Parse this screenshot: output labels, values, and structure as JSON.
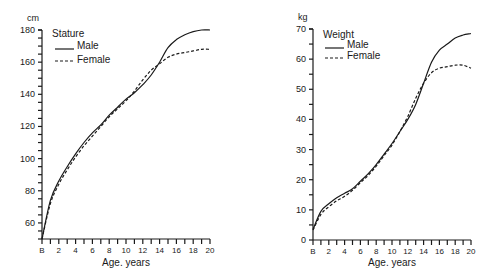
{
  "chart_data": [
    {
      "type": "line",
      "title": "Stature",
      "xlabel": "Age. years",
      "ylabel": "cm",
      "x_tick_labels": [
        "B",
        "2",
        "4",
        "6",
        "8",
        "10",
        "12",
        "14",
        "16",
        "18",
        "20"
      ],
      "y_tick_labels": [
        "60",
        "80",
        "100",
        "120",
        "140",
        "160",
        "180"
      ],
      "xlim": [
        0,
        20
      ],
      "ylim": [
        50,
        180
      ],
      "grid": false,
      "legend_position": "upper-left",
      "x": [
        0,
        1,
        2,
        3,
        4,
        5,
        6,
        7,
        8,
        9,
        10,
        11,
        12,
        13,
        14,
        15,
        16,
        17,
        18,
        19,
        20
      ],
      "series": [
        {
          "name": "Male",
          "style": "solid",
          "values": [
            50,
            74,
            86,
            95,
            103,
            110,
            116,
            121,
            127,
            132,
            137,
            141,
            146,
            152,
            160,
            169,
            174,
            177,
            179,
            180,
            180
          ]
        },
        {
          "name": "Female",
          "style": "dashed",
          "values": [
            50,
            72,
            84,
            93,
            101,
            108,
            114,
            120,
            126,
            131,
            136,
            142,
            149,
            155,
            159,
            163,
            165,
            166,
            167,
            168,
            168
          ]
        }
      ]
    },
    {
      "type": "line",
      "title": "Weight",
      "xlabel": "Age. years",
      "ylabel": "kg",
      "x_tick_labels": [
        "B",
        "2",
        "4",
        "6",
        "8",
        "10",
        "12",
        "14",
        "16",
        "18",
        "20"
      ],
      "y_tick_labels": [
        "0",
        "10",
        "20",
        "30",
        "40",
        "50",
        "60",
        "70"
      ],
      "xlim": [
        0,
        20
      ],
      "ylim": [
        0,
        70
      ],
      "grid": false,
      "legend_position": "upper-left",
      "x": [
        0,
        1,
        2,
        3,
        4,
        5,
        6,
        7,
        8,
        9,
        10,
        11,
        12,
        13,
        14,
        15,
        16,
        17,
        18,
        19,
        20
      ],
      "series": [
        {
          "name": "Male",
          "style": "solid",
          "values": [
            3.5,
            9.5,
            12,
            14,
            15.5,
            17,
            19.5,
            22,
            25,
            28.5,
            32,
            36,
            40,
            45,
            52,
            59,
            63,
            65,
            67,
            68,
            68.5
          ]
        },
        {
          "name": "Female",
          "style": "dashed",
          "values": [
            3.3,
            8.5,
            11,
            13,
            14.5,
            16.5,
            19,
            21.5,
            24.5,
            28,
            31.5,
            36,
            41,
            47,
            52,
            55.5,
            57,
            57.5,
            58,
            58,
            57
          ]
        }
      ]
    }
  ],
  "colors": {
    "ink": "#1a1a1a",
    "background": "#ffffff"
  }
}
